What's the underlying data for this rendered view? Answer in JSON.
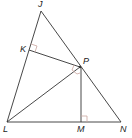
{
  "diagram": {
    "type": "geometry",
    "points": {
      "J": {
        "label": "J",
        "x": 41,
        "y": 11
      },
      "K": {
        "label": "K",
        "x": 29,
        "y": 50
      },
      "P": {
        "label": "P",
        "x": 80,
        "y": 67
      },
      "L": {
        "label": "L",
        "x": 7,
        "y": 122
      },
      "M": {
        "label": "M",
        "x": 81,
        "y": 122
      },
      "N": {
        "label": "N",
        "x": 121,
        "y": 122
      }
    },
    "segments": [
      "JL",
      "JN",
      "LN",
      "KP",
      "LP",
      "PM"
    ],
    "right_angles": [
      "JKP",
      "PMN",
      "KPL-bisector-mark"
    ],
    "stroke_color": "#333333",
    "accent_color": "#c9a6a0"
  }
}
